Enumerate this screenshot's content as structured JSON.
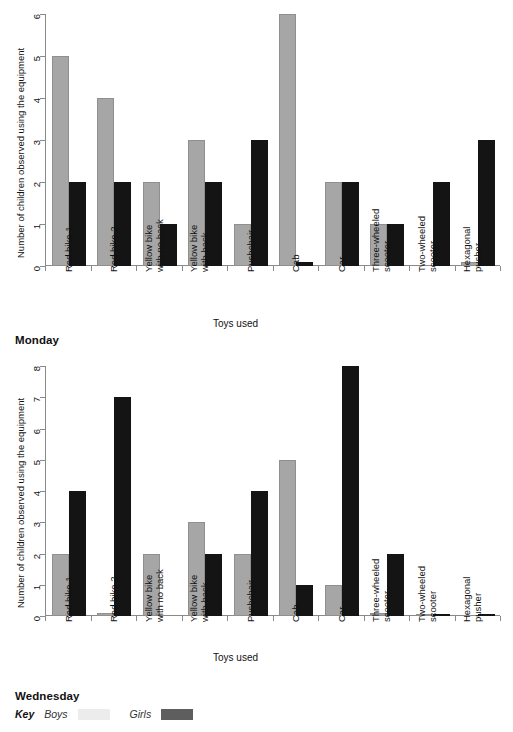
{
  "top_caption": "",
  "charts": [
    {
      "id": "monday",
      "day_label": "Monday",
      "ylabel": "Number of children observed using the equipment",
      "xlabel": "Toys used",
      "ylim": [
        0,
        6
      ],
      "yticks": [
        "0",
        "1",
        "2",
        "3",
        "4",
        "5",
        "6"
      ],
      "categories": [
        [
          "Red bike 1"
        ],
        [
          "Red bike 2"
        ],
        [
          "Yellow bike",
          "with no back"
        ],
        [
          "Yellow bike",
          "with back"
        ],
        [
          "Pushchair"
        ],
        [
          "Cab"
        ],
        [
          "Car"
        ],
        [
          "Three-wheeled",
          "scooter"
        ],
        [
          "Two-wheeled",
          "scooter"
        ],
        [
          "Hexagonal",
          "pusher"
        ]
      ],
      "series": [
        {
          "name": "Boys",
          "values": [
            5,
            4,
            2,
            3,
            1,
            6,
            2,
            1,
            0,
            0.1
          ]
        },
        {
          "name": "Girls",
          "values": [
            2,
            2,
            1,
            2,
            3,
            0.1,
            2,
            1,
            2,
            3
          ]
        }
      ]
    },
    {
      "id": "wednesday",
      "day_label": "Wednesday",
      "ylabel": "Number of children observed using the equipment",
      "xlabel": "Toys used",
      "ylim": [
        0,
        8
      ],
      "yticks": [
        "0",
        "1",
        "2",
        "3",
        "4",
        "5",
        "6",
        "7",
        "8"
      ],
      "categories": [
        [
          "Red bike 1"
        ],
        [
          "Red bike 2"
        ],
        [
          "Yellow bike",
          "with no back"
        ],
        [
          "Yellow bike",
          "with back"
        ],
        [
          "Pushchair"
        ],
        [
          "Cab"
        ],
        [
          "Car"
        ],
        [
          "Three-wheeled",
          "scooter"
        ],
        [
          "Two-wheeled",
          "scooter"
        ],
        [
          "Hexagonal",
          "pusher"
        ]
      ],
      "series": [
        {
          "name": "Boys",
          "values": [
            2,
            0.1,
            2,
            3,
            2,
            5,
            1,
            0.1,
            0.07,
            0
          ]
        },
        {
          "name": "Girls",
          "values": [
            4,
            7,
            0,
            2,
            4,
            1,
            8,
            2,
            0.07,
            0.07
          ]
        }
      ]
    }
  ],
  "legend": {
    "key_label": "Key",
    "entries": [
      {
        "name": "Boys",
        "color": "#ececec"
      },
      {
        "name": "Girls",
        "color": "#5e5e5e"
      }
    ]
  },
  "chart_data": {
    "type": "bar",
    "xlabel": "Toys used",
    "ylabel": "Number of children observed using the equipment",
    "categories": [
      "Red bike 1",
      "Red bike 2",
      "Yellow bike with no back",
      "Yellow bike with back",
      "Pushchair",
      "Cab",
      "Car",
      "Three-wheeled scooter",
      "Two-wheeled scooter",
      "Hexagonal pusher"
    ],
    "panels": [
      {
        "panel": "Monday",
        "ylim": [
          0,
          6
        ],
        "series": [
          {
            "name": "Boys",
            "values": [
              5,
              4,
              2,
              3,
              1,
              6,
              2,
              1,
              0,
              0.1
            ]
          },
          {
            "name": "Girls",
            "values": [
              2,
              2,
              1,
              2,
              3,
              0.1,
              2,
              1,
              2,
              3
            ]
          }
        ]
      },
      {
        "panel": "Wednesday",
        "ylim": [
          0,
          8
        ],
        "series": [
          {
            "name": "Boys",
            "values": [
              2,
              0.1,
              2,
              3,
              2,
              5,
              1,
              0.1,
              0.07,
              0
            ]
          },
          {
            "name": "Girls",
            "values": [
              4,
              7,
              0,
              2,
              4,
              1,
              8,
              2,
              0.07,
              0.07
            ]
          }
        ]
      }
    ],
    "legend": [
      "Boys",
      "Girls"
    ],
    "legend_position": "bottom-left",
    "grid": false
  }
}
